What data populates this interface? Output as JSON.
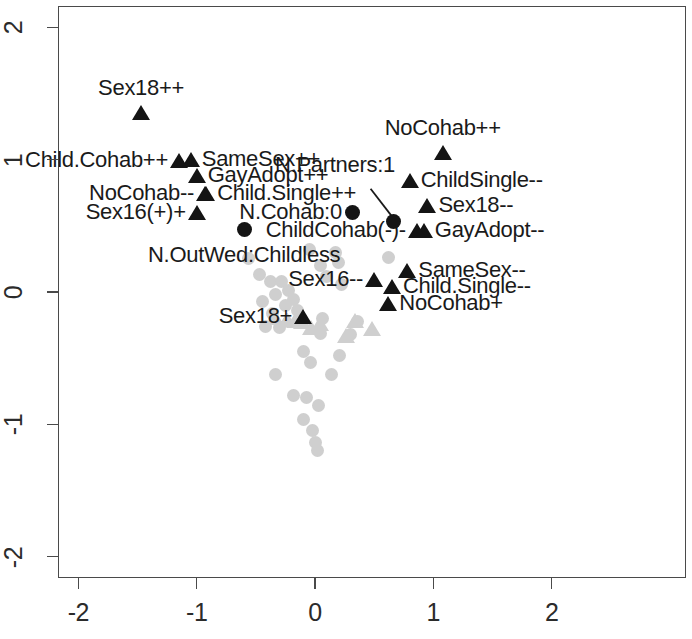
{
  "chart_data": {
    "type": "scatter",
    "title": "",
    "xlabel": "",
    "ylabel": "",
    "xlim": [
      -2.35,
      1.15
    ],
    "ylim": [
      -2.2,
      2.25
    ],
    "xticks": [
      -2,
      -1,
      0,
      1,
      2
    ],
    "yticks": [
      -2,
      -1,
      0,
      1,
      2
    ],
    "xticklabels": [
      "-2",
      "-1",
      "0",
      "1",
      "2"
    ],
    "yticklabels": [
      "-2",
      "-1",
      "0",
      "1",
      "2"
    ],
    "grid": false,
    "legend": "none",
    "colors": {
      "highlight": "#141414",
      "background_points": "#cfcfcf",
      "axis": "#4a4a4a",
      "text": "#1a1a1a",
      "plot_background": "#ffffff"
    },
    "series": [
      {
        "name": "Attitude categories (highlighted)",
        "marker": "triangle",
        "color": "#141414",
        "points": [
          {
            "label": "Sex18++",
            "x": -1.47,
            "y": 1.35,
            "label_pos": "above"
          },
          {
            "label": "Child.Cohab++",
            "x": -1.15,
            "y": 0.99,
            "label_pos": "left"
          },
          {
            "label": "SameSex++",
            "x": -1.05,
            "y": 1.0,
            "label_pos": "right"
          },
          {
            "label": "GayAdopt++",
            "x": -1.0,
            "y": 0.88,
            "label_pos": "right"
          },
          {
            "label": "NoCohab--",
            "x": -0.93,
            "y": 0.74,
            "label_pos": "left"
          },
          {
            "label": "Child.Single++",
            "x": -0.92,
            "y": 0.74,
            "label_pos": "right"
          },
          {
            "label": "Sex16(+)+",
            "x": -1.0,
            "y": 0.6,
            "label_pos": "left"
          },
          {
            "label": "NoCohab++",
            "x": 1.08,
            "y": 1.05,
            "label_pos": "above"
          },
          {
            "label": "ChildSingle--",
            "x": 0.8,
            "y": 0.84,
            "label_pos": "right"
          },
          {
            "label": "Sex18--",
            "x": 0.95,
            "y": 0.65,
            "label_pos": "right"
          },
          {
            "label": "GayAdopt--",
            "x": 0.92,
            "y": 0.46,
            "label_pos": "right"
          },
          {
            "label": "ChildCohab(-)-",
            "x": 0.86,
            "y": 0.46,
            "label_pos": "left"
          },
          {
            "label": "SameSex--",
            "x": 0.78,
            "y": 0.16,
            "label_pos": "right"
          },
          {
            "label": "Child.Single--",
            "x": 0.65,
            "y": 0.04,
            "label_pos": "right"
          },
          {
            "label": "NoCohab+",
            "x": 0.62,
            "y": -0.09,
            "label_pos": "right"
          },
          {
            "label": "Sex16--",
            "x": 0.5,
            "y": 0.09,
            "label_pos": "left"
          },
          {
            "label": "Sex18+",
            "x": -0.1,
            "y": -0.19,
            "label_pos": "left"
          }
        ]
      },
      {
        "name": "Demographic categories (highlighted)",
        "marker": "circle",
        "color": "#141414",
        "points": [
          {
            "label": "N.OutWed:Childless",
            "x": -0.6,
            "y": 0.47,
            "label_pos": "below"
          },
          {
            "label": "N.Cohab:0",
            "x": 0.32,
            "y": 0.6,
            "label_pos": "left"
          },
          {
            "label": "N.Partners:1",
            "x": 0.66,
            "y": 0.53,
            "label_pos": "leader"
          }
        ]
      },
      {
        "name": "Other categories (background)",
        "marker": "circle",
        "color": "#cfcfcf",
        "points": [
          {
            "x": -0.56,
            "y": 0.25
          },
          {
            "x": -0.05,
            "y": 0.32
          },
          {
            "x": 0.05,
            "y": 0.2
          },
          {
            "x": 0.2,
            "y": 0.22
          },
          {
            "x": 0.1,
            "y": 0.12
          },
          {
            "x": 0.22,
            "y": 0.06
          },
          {
            "x": -0.38,
            "y": 0.08
          },
          {
            "x": -0.28,
            "y": 0.08
          },
          {
            "x": -0.22,
            "y": 0.01
          },
          {
            "x": -0.33,
            "y": -0.02
          },
          {
            "x": -0.18,
            "y": -0.06
          },
          {
            "x": -0.25,
            "y": -0.1
          },
          {
            "x": -0.44,
            "y": -0.07
          },
          {
            "x": -0.36,
            "y": -0.16
          },
          {
            "x": -0.15,
            "y": -0.14
          },
          {
            "x": -0.42,
            "y": -0.26
          },
          {
            "x": -0.3,
            "y": -0.27
          },
          {
            "x": 0.06,
            "y": -0.2
          },
          {
            "x": 0.36,
            "y": -0.22
          },
          {
            "x": 0.05,
            "y": -0.31
          },
          {
            "x": 0.3,
            "y": -0.32
          },
          {
            "x": -0.1,
            "y": -0.45
          },
          {
            "x": -0.04,
            "y": -0.53
          },
          {
            "x": 0.21,
            "y": -0.48
          },
          {
            "x": -0.33,
            "y": -0.62
          },
          {
            "x": 0.14,
            "y": -0.62
          },
          {
            "x": -0.18,
            "y": -0.78
          },
          {
            "x": -0.07,
            "y": -0.8
          },
          {
            "x": 0.03,
            "y": -0.86
          },
          {
            "x": -0.1,
            "y": -0.96
          },
          {
            "x": -0.02,
            "y": -1.05
          },
          {
            "x": 0.0,
            "y": -1.14
          },
          {
            "x": 0.02,
            "y": -1.2
          },
          {
            "x": -0.47,
            "y": 0.13
          },
          {
            "x": 0.17,
            "y": 0.3
          },
          {
            "x": 0.62,
            "y": 0.26
          }
        ]
      },
      {
        "name": "Other categories (background triangles)",
        "marker": "triangle",
        "color": "#cfcfcf",
        "points": [
          {
            "x": -0.24,
            "y": -0.21
          },
          {
            "x": -0.17,
            "y": -0.22
          },
          {
            "x": -0.11,
            "y": -0.23
          },
          {
            "x": -0.03,
            "y": -0.27
          },
          {
            "x": 0.04,
            "y": -0.24
          },
          {
            "x": 0.34,
            "y": -0.22
          },
          {
            "x": 0.26,
            "y": -0.33
          },
          {
            "x": 0.48,
            "y": -0.28
          },
          {
            "x": -0.34,
            "y": -0.2
          }
        ]
      }
    ],
    "annotations": [
      {
        "text": "N.Partners:1",
        "type": "leader-line",
        "from_x": 0.47,
        "from_y": 0.78,
        "to_x": 0.66,
        "to_y": 0.56
      }
    ]
  }
}
